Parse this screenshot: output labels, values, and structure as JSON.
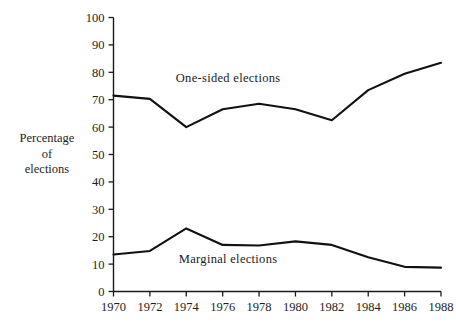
{
  "figure": {
    "y_axis_title_lines": [
      "Percentage",
      "of",
      "elections"
    ]
  },
  "chart_data": {
    "type": "line",
    "title": "",
    "subtitle": "",
    "xlabel": "",
    "ylabel": "Percentage of elections",
    "x": [
      1970,
      1972,
      1974,
      1976,
      1978,
      1980,
      1982,
      1984,
      1986,
      1988
    ],
    "categories": [
      "1970",
      "1972",
      "1974",
      "1976",
      "1978",
      "1980",
      "1982",
      "1984",
      "1986",
      "1988"
    ],
    "xlim": [
      1970,
      1988
    ],
    "ylim": [
      0,
      100
    ],
    "ytick_labels": [
      "0",
      "10",
      "20",
      "30",
      "40",
      "50",
      "60",
      "70",
      "80",
      "90",
      "100"
    ],
    "ytick_values": [
      0,
      10,
      20,
      30,
      40,
      50,
      60,
      70,
      80,
      90,
      100
    ],
    "xtick_labels": [
      "1970",
      "1972",
      "1974",
      "1976",
      "1978",
      "1980",
      "1982",
      "1984",
      "1986",
      "1988"
    ],
    "grid": false,
    "legend": "inline-labels",
    "line_color": "#111111",
    "series": [
      {
        "name": "One-sided elections",
        "label": "One-sided elections",
        "values": [
          71.5,
          70.3,
          60.0,
          66.5,
          68.5,
          66.5,
          62.5,
          73.5,
          79.5,
          83.5
        ]
      },
      {
        "name": "Marginal elections",
        "label": "Marginal elections",
        "values": [
          13.5,
          14.8,
          23.0,
          17.0,
          16.8,
          18.3,
          17.0,
          12.5,
          9.0,
          8.7
        ]
      }
    ],
    "annotations": [
      {
        "text": "One-sided elections",
        "x": 1976.3,
        "y": 76.5
      },
      {
        "text": "Marginal elections",
        "x": 1976.3,
        "y": 10.5
      }
    ]
  }
}
